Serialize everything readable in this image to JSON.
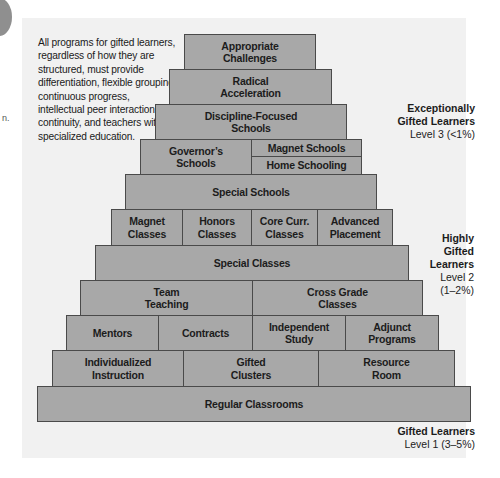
{
  "side_fragment": {
    "text": "n."
  },
  "note": "All programs for gifted learners, regardless of how they are structured, must provide differentiation, flexible grouping, continuous progress, intellectual peer interaction, continuity, and teachers with specialized education.",
  "colors": {
    "block_fill": "#a8a8a8",
    "block_border": "#4a4a4a",
    "panel_bg": "#f1f1f1"
  },
  "levels": [
    {
      "title": "Exceptionally\nGifted Learners",
      "sub": "Level 3 (<1%)"
    },
    {
      "title": "Highly\nGifted\nLearners",
      "sub": "Level 2\n(1–2%)"
    },
    {
      "title": "Gifted Learners",
      "sub": "Level 1 (3–5%)"
    }
  ],
  "pyramid": {
    "appropriate": "Appropriate\nChallenges",
    "radical": "Radical\nAcceleration",
    "discipline": "Discipline-Focused\nSchools",
    "governors": "Governor’s\nSchools",
    "magnet_schools": "Magnet Schools",
    "home_schooling": "Home Schooling",
    "special_schools": "Special Schools",
    "magnet_classes": "Magnet\nClasses",
    "honors": "Honors\nClasses",
    "core": "Core Curr.\nClasses",
    "advanced": "Advanced\nPlacement",
    "special_classes": "Special Classes",
    "team": "Team\nTeaching",
    "cross": "Cross Grade\nClasses",
    "mentors": "Mentors",
    "contracts": "Contracts",
    "independent": "Independent\nStudy",
    "adjunct": "Adjunct\nPrograms",
    "individualized": "Individualized\nInstruction",
    "gifted_clusters": "Gifted\nClusters",
    "resource": "Resource\nRoom",
    "regular": "Regular Classrooms"
  }
}
